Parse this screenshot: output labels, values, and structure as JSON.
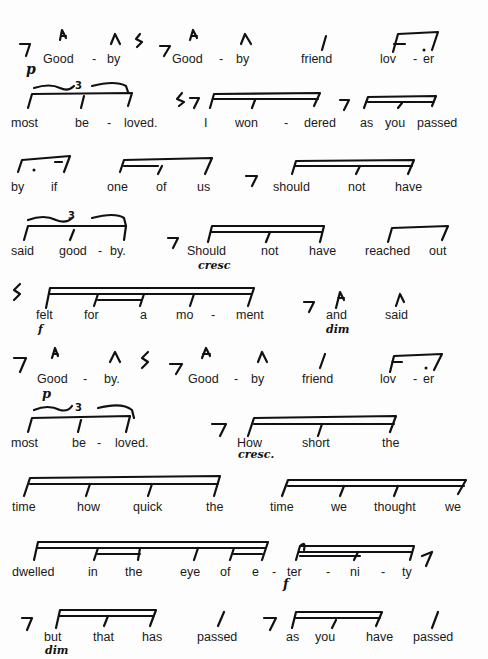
{
  "score": {
    "systems": [
      {
        "id": 1,
        "words": [
          "Good",
          "-",
          "by",
          "Good",
          "-",
          "by",
          "friend",
          "lov",
          "-",
          "er"
        ],
        "dynamics": [
          "p"
        ]
      },
      {
        "id": 2,
        "words": [
          "most",
          "be",
          "-",
          "loved.",
          "I",
          "won",
          "-",
          "dered",
          "as",
          "you",
          "passed"
        ],
        "tuplet": "3"
      },
      {
        "id": 3,
        "words": [
          "by",
          "if",
          "one",
          "of",
          "us",
          "should",
          "not",
          "have"
        ]
      },
      {
        "id": 4,
        "words": [
          "said",
          "good",
          "-",
          "by.",
          "Should",
          "not",
          "have",
          "reached",
          "out"
        ],
        "tuplet": "3",
        "dynamics": [
          "cresc"
        ]
      },
      {
        "id": 5,
        "words": [
          "felt",
          "for",
          "a",
          "mo",
          "-",
          "ment",
          "and",
          "said"
        ],
        "dynamics": [
          "f",
          "dim"
        ]
      },
      {
        "id": 6,
        "words": [
          "Good",
          "-",
          "by.",
          "Good",
          "-",
          "by",
          "friend",
          "lov",
          "-",
          "er"
        ],
        "dynamics": [
          "p"
        ]
      },
      {
        "id": 7,
        "words": [
          "most",
          "be",
          "-",
          "loved.",
          "How",
          "short",
          "the"
        ],
        "tuplet": "3",
        "dynamics": [
          "cresc."
        ]
      },
      {
        "id": 8,
        "words": [
          "time",
          "how",
          "quick",
          "the",
          "time",
          "we",
          "thought",
          "we"
        ]
      },
      {
        "id": 9,
        "words": [
          "dwelled",
          "in",
          "the",
          "eye",
          "of",
          "e",
          "-",
          "ter",
          "-",
          "ni",
          "-",
          "ty"
        ],
        "dynamics": [
          "f"
        ]
      },
      {
        "id": 10,
        "words": [
          "but",
          "that",
          "has",
          "passed",
          "as",
          "you",
          "have",
          "passed"
        ],
        "dynamics": [
          "dim"
        ]
      }
    ]
  }
}
